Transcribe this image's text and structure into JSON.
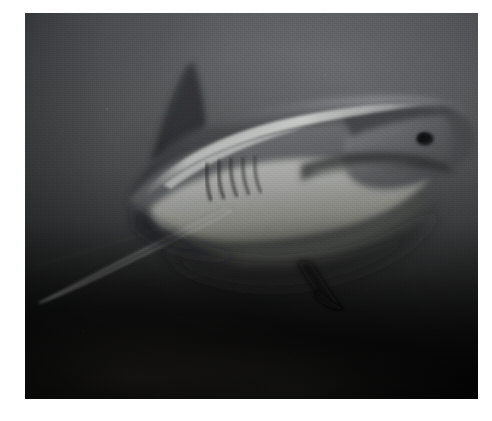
{
  "image": {
    "kind": "photograph",
    "subject": "shark",
    "scene": "underwater",
    "orientation": "landscape",
    "width_px": 492,
    "height_px": 421,
    "border": {
      "style": "solid white mat",
      "color": "#ffffff",
      "left_px": 25,
      "top_px": 13,
      "right_px": 14,
      "bottom_px": 22
    },
    "photo": {
      "x_px": 25,
      "y_px": 13,
      "width_px": 453,
      "height_px": 386
    },
    "palette": {
      "water_upper": "#5e6063",
      "water_mid": "#3b3c3d",
      "water_lower": "#0a0a0a",
      "seafloor": "#020202",
      "shark_dorsal": "#3a3c3e",
      "shark_flank": "#6b6d6f",
      "shark_belly": "#a9aaa8",
      "shark_highlight": "#c9cac7",
      "fin_dark": "#2a2c2e",
      "border": "#ffffff"
    },
    "subject_parts": [
      {
        "name": "dorsal-fin",
        "description": "tall dark triangular first dorsal fin, upper-left of body"
      },
      {
        "name": "snout",
        "description": "conical pointed snout at right edge of frame"
      },
      {
        "name": "eye",
        "description": "small dark eye just behind and above the mouth line"
      },
      {
        "name": "mouth",
        "description": "crescent mouth line along lower right of head"
      },
      {
        "name": "gill-slits",
        "description": "five vertical dark gill slits on the left flank"
      },
      {
        "name": "pectoral-fin",
        "description": "long slender pectoral fin sweeping down and left"
      },
      {
        "name": "pelvic-fin",
        "description": "small dark fin below mid-body"
      },
      {
        "name": "belly",
        "description": "pale countershaded white underside"
      },
      {
        "name": "dorsal-ridge-highlight",
        "description": "bright specular line along the back"
      }
    ]
  }
}
